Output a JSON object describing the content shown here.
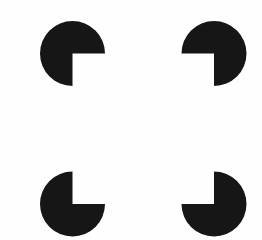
{
  "canvas": {
    "width": 262,
    "height": 240,
    "background_color": "#fefefe",
    "ink_color": "#161616"
  },
  "figure": {
    "name": "Kanizsa square",
    "type": "illusory-contour-figure",
    "inducer_shape": "pacman-disc",
    "inducer_count": 4,
    "notch_angle_degrees": 90,
    "notches_point": "inward",
    "support_ratio_percent": 45
  },
  "inducers": [
    {
      "id": "top-left",
      "label": "top-left-pacman",
      "cx": 72.5,
      "cy": 53.5,
      "r": 32.5,
      "missing_wedge_quadrant": "bottom-right",
      "wedge_start_deg": 0,
      "wedge_end_deg": 90,
      "corner_x": 72.5,
      "corner_y": 53.5,
      "color": "#161616"
    },
    {
      "id": "top-right",
      "label": "top-right-pacman",
      "cx": 214.0,
      "cy": 53.5,
      "r": 32.5,
      "missing_wedge_quadrant": "bottom-left",
      "wedge_start_deg": 90,
      "wedge_end_deg": 180,
      "corner_x": 214.0,
      "corner_y": 53.5,
      "color": "#161616"
    },
    {
      "id": "bottom-left",
      "label": "bottom-left-pacman",
      "cx": 72.5,
      "cy": 204.0,
      "r": 32.5,
      "missing_wedge_quadrant": "top-right",
      "wedge_start_deg": 270,
      "wedge_end_deg": 360,
      "corner_x": 72.5,
      "corner_y": 204.0,
      "color": "#161616"
    },
    {
      "id": "bottom-right",
      "label": "bottom-right-pacman",
      "cx": 214.0,
      "cy": 204.0,
      "r": 32.5,
      "missing_wedge_quadrant": "top-left",
      "wedge_start_deg": 180,
      "wedge_end_deg": 270,
      "corner_x": 214.0,
      "corner_y": 204.0,
      "color": "#161616"
    }
  ],
  "illusory_square": {
    "label": "illusory-square",
    "left": 72.5,
    "top": 53.5,
    "right": 214.0,
    "bottom": 204.0,
    "width": 141.5,
    "height": 150.5,
    "fill": "none"
  }
}
